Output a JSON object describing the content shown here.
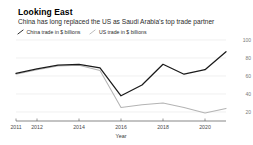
{
  "header": {
    "title": "Looking East",
    "subtitle": "China has long replaced the US as Saudi Arabia's top trade partner"
  },
  "legend": {
    "items": [
      {
        "label": "China trade in $ billions",
        "color": "#1a1a1a",
        "marker": "diagonal-line-marker"
      },
      {
        "label": "US trade in $ billions",
        "color": "#b4b4b4",
        "marker": "diagonal-line-marker"
      }
    ]
  },
  "chart_data": {
    "type": "line",
    "title": "Looking East",
    "subtitle": "China has long replaced the US as Saudi Arabia's top trade partner",
    "xlabel": "Year",
    "ylabel": "",
    "x": [
      2011,
      2012,
      2013,
      2014,
      2015,
      2016,
      2017,
      2018,
      2019,
      2020,
      2021
    ],
    "xlim": [
      2011,
      2021
    ],
    "ylim": [
      10,
      100
    ],
    "yticks": [
      20,
      40,
      60,
      80,
      100
    ],
    "xticks": [
      2011,
      2012,
      2014,
      2016,
      2018,
      2020
    ],
    "xtick_labels": [
      "2011",
      "2012",
      "2014",
      "2016",
      "2018",
      "2020"
    ],
    "ytick_labels": [
      "20",
      "40",
      "60",
      "80",
      "100"
    ],
    "y_axis_position": "right",
    "grid": "horizontal",
    "legend_position": "top-left",
    "series": [
      {
        "name": "China trade in $ billions",
        "color": "#1a1a1a",
        "values": [
          63,
          68,
          72,
          73,
          69,
          38,
          50,
          73,
          62,
          67,
          87
        ]
      },
      {
        "name": "US trade in $ billions",
        "color": "#b4b4b4",
        "values": [
          62,
          67,
          71,
          72,
          66,
          25,
          28,
          30,
          25,
          19,
          24
        ]
      }
    ]
  },
  "axis": {
    "x_label": "Year"
  }
}
